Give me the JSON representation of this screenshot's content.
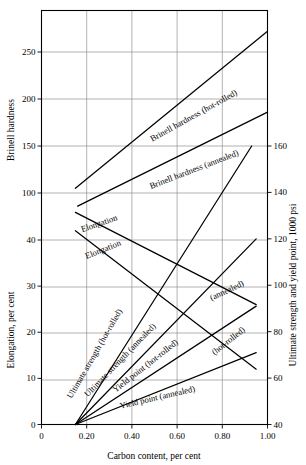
{
  "figure": {
    "title": "",
    "background_color": "#ffffff",
    "line_color": "#000000",
    "grid_color": "#8a8a8a"
  },
  "axes": {
    "x": {
      "title": "Carbon content, per cent",
      "ticks": [
        "0",
        "0.20",
        "0.40",
        "0.60",
        "0.80",
        "1.00"
      ],
      "values": [
        0,
        0.2,
        0.4,
        0.6,
        0.8,
        1.0
      ],
      "min": 0,
      "max": 1.0
    },
    "left_upper": {
      "title": "Brinell hardness",
      "ticks": [
        "250",
        "200",
        "150",
        "100"
      ],
      "values": [
        250,
        200,
        150,
        100
      ]
    },
    "left_lower": {
      "title": "Elongation, per cent",
      "ticks": [
        "40",
        "30",
        "20",
        "10",
        "0"
      ],
      "values": [
        40,
        30,
        20,
        10,
        0
      ]
    },
    "right": {
      "title": "Ultimate strength and yield point, 1000 psi",
      "ticks": [
        "160",
        "140",
        "120",
        "100",
        "80",
        "60",
        "40"
      ],
      "values": [
        160,
        140,
        120,
        100,
        80,
        60,
        40
      ]
    }
  },
  "chart_data": {
    "type": "line",
    "title": "",
    "xlabel": "Carbon content, per cent",
    "ylabel": "Brinell hardness / Elongation, per cent",
    "y2label": "Ultimate strength and yield point, 1000 psi",
    "xlim": [
      0,
      1.0
    ],
    "grid": true,
    "legend": "inline-labels",
    "series": [
      {
        "name": "Brinell hardness (hot-rolled)",
        "axis": "brinell",
        "x": [
          0.15,
          1.0
        ],
        "y": [
          105,
          272
        ],
        "label": "Brinell hardness (hot-rolled)"
      },
      {
        "name": "Brinell hardness (annealed)",
        "axis": "brinell",
        "x": [
          0.16,
          1.0
        ],
        "y": [
          86,
          186
        ],
        "label": "Brinell hardness (annealed)"
      },
      {
        "name": "Elongation (annealed)",
        "axis": "elongation",
        "x": [
          0.15,
          0.95
        ],
        "y": [
          46,
          26
        ],
        "label": "Elongation"
      },
      {
        "name": "Elongation (hot-rolled)",
        "axis": "elongation",
        "x": [
          0.15,
          0.95
        ],
        "y": [
          42,
          12
        ],
        "label": "Elongation"
      },
      {
        "name": "Ultimate strength (hot-rolled)",
        "axis": "psi",
        "x": [
          0.15,
          0.93
        ],
        "y": [
          40,
          160
        ],
        "label": "Ultimate strength (hot-rolled)"
      },
      {
        "name": "Ultimate strength (annealed)",
        "axis": "psi",
        "x": [
          0.15,
          0.95
        ],
        "y": [
          40,
          120
        ],
        "label": "Ultimate strength (annealed)"
      },
      {
        "name": "Yield point (hot-rolled)",
        "axis": "psi",
        "x": [
          0.15,
          0.95
        ],
        "y": [
          40,
          91
        ],
        "label": "Yield point (hot-rolled)"
      },
      {
        "name": "Yield point (annealed)",
        "axis": "psi",
        "x": [
          0.15,
          0.95
        ],
        "y": [
          40,
          71
        ],
        "label": "Yield point (annealed)"
      }
    ],
    "inline_annotations": [
      {
        "text": "Brinell hardness (hot-rolled)",
        "x": 195,
        "y": 118,
        "rotate": -29
      },
      {
        "text": "Brinell hardness (annealed)",
        "x": 195,
        "y": 172,
        "rotate": -21
      },
      {
        "text": "Elongation",
        "x": 100,
        "y": 226,
        "rotate": -19
      },
      {
        "text": "Elongation",
        "x": 104,
        "y": 252,
        "rotate": -22
      },
      {
        "text": "(annealed)",
        "x": 228,
        "y": 293,
        "rotate": -25
      },
      {
        "text": "(hot-rolled)",
        "x": 230,
        "y": 343,
        "rotate": -38
      },
      {
        "text": "Ultimate strength (hot-rolled)",
        "x": 97,
        "y": 355,
        "rotate": -60
      },
      {
        "text": "Ultimate strength (annealed)",
        "x": 122,
        "y": 362,
        "rotate": -46
      },
      {
        "text": "Yield point (hot-rolled)",
        "x": 147,
        "y": 368,
        "rotate": -38
      },
      {
        "text": "Yield point (annealed)",
        "x": 158,
        "y": 400,
        "rotate": -13
      }
    ]
  }
}
